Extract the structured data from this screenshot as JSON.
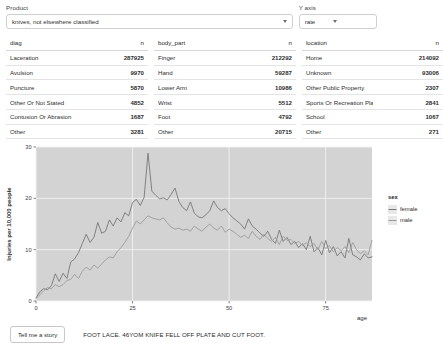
{
  "controls": {
    "product": {
      "label": "Product",
      "value": "knives, not elsewhere classified",
      "caret": "chevron-down-icon"
    },
    "yaxis": {
      "label": "Y axis",
      "value": "rate",
      "caret": "chevron-down-icon"
    }
  },
  "tables": [
    {
      "id": "diag",
      "headers": [
        "diag",
        "n"
      ],
      "rows": [
        {
          "label": "Laceration",
          "n": "287925"
        },
        {
          "label": "Avulsion",
          "n": "9970"
        },
        {
          "label": "Puncture",
          "n": "5870"
        },
        {
          "label": "Other Or Not Stated",
          "n": "4852"
        },
        {
          "label": "Contusion Or Abrasion",
          "n": "1687"
        },
        {
          "label": "Other",
          "n": "3281"
        }
      ]
    },
    {
      "id": "body_part",
      "headers": [
        "body_part",
        "n"
      ],
      "rows": [
        {
          "label": "Finger",
          "n": "212292"
        },
        {
          "label": "Hand",
          "n": "59287"
        },
        {
          "label": "Lower Arm",
          "n": "10986"
        },
        {
          "label": "Wrist",
          "n": "5512"
        },
        {
          "label": "Foot",
          "n": "4792"
        },
        {
          "label": "Other",
          "n": "20715"
        }
      ]
    },
    {
      "id": "location",
      "headers": [
        "location",
        "n"
      ],
      "rows": [
        {
          "label": "Home",
          "n": "214092"
        },
        {
          "label": "Unknown",
          "n": "93006"
        },
        {
          "label": "Other Public Property",
          "n": "2307"
        },
        {
          "label": "Sports Or Recreation Place",
          "n": "2841"
        },
        {
          "label": "School",
          "n": "1067"
        },
        {
          "label": "Other",
          "n": "271"
        }
      ]
    }
  ],
  "chart_data": {
    "type": "line",
    "title": "",
    "xlabel": "age",
    "ylabel": "Injuries per 10,000 people",
    "xlim": [
      0,
      87
    ],
    "ylim": [
      0,
      30
    ],
    "xticks": [
      0,
      25,
      50,
      75
    ],
    "yticks": [
      0,
      10,
      20,
      30
    ],
    "grid": true,
    "legend": {
      "title": "sex",
      "position": "right",
      "entries": [
        {
          "name": "female",
          "color": "#7a7a7a"
        },
        {
          "name": "male",
          "color": "#9a9a9a"
        }
      ]
    },
    "panel_bg": "#d3d3d3",
    "grid_color": "#f2f2f2",
    "x": [
      0,
      1,
      2,
      3,
      4,
      5,
      6,
      7,
      8,
      9,
      10,
      11,
      12,
      13,
      14,
      15,
      16,
      17,
      18,
      19,
      20,
      21,
      22,
      23,
      24,
      25,
      26,
      27,
      28,
      29,
      30,
      31,
      32,
      33,
      34,
      35,
      36,
      37,
      38,
      39,
      40,
      41,
      42,
      43,
      44,
      45,
      46,
      47,
      48,
      49,
      50,
      51,
      52,
      53,
      54,
      55,
      56,
      57,
      58,
      59,
      60,
      61,
      62,
      63,
      64,
      65,
      66,
      67,
      68,
      69,
      70,
      71,
      72,
      73,
      74,
      75,
      76,
      77,
      78,
      79,
      80,
      81,
      82,
      83,
      84,
      85,
      86,
      87
    ],
    "series": [
      {
        "name": "female",
        "color": "#777777",
        "values": [
          0.6,
          1.8,
          2.4,
          2.2,
          3.0,
          5.3,
          3.8,
          5.4,
          4.4,
          7.6,
          8.2,
          9.4,
          11.2,
          13.0,
          11.4,
          12.4,
          15.3,
          13.2,
          13.6,
          15.8,
          14.6,
          16.2,
          15.4,
          17.2,
          16.6,
          19.2,
          19.8,
          18.6,
          20.2,
          28.8,
          21.4,
          20.6,
          19.9,
          20.1,
          19.7,
          20.8,
          22.0,
          19.4,
          18.2,
          17.6,
          19.3,
          17.1,
          16.4,
          16.2,
          16.8,
          17.6,
          19.5,
          18.2,
          17.6,
          18.0,
          17.0,
          16.2,
          15.6,
          15.0,
          14.0,
          16.0,
          14.6,
          14.0,
          13.2,
          12.6,
          13.6,
          12.0,
          11.2,
          13.8,
          11.6,
          12.4,
          11.0,
          11.6,
          10.4,
          11.2,
          10.0,
          12.6,
          9.6,
          10.4,
          9.0,
          11.8,
          9.4,
          10.6,
          8.8,
          9.6,
          8.4,
          12.2,
          9.0,
          8.6,
          8.0,
          9.2,
          8.4,
          8.6
        ]
      },
      {
        "name": "male",
        "color": "#9c9c9c",
        "values": [
          0.5,
          1.2,
          2.0,
          2.6,
          2.4,
          3.2,
          2.8,
          3.2,
          4.0,
          4.2,
          5.2,
          4.4,
          5.8,
          6.6,
          6.0,
          7.0,
          6.4,
          7.2,
          8.0,
          8.6,
          8.4,
          9.6,
          10.4,
          11.4,
          12.6,
          14.2,
          15.6,
          15.0,
          15.8,
          16.6,
          16.2,
          16.0,
          15.8,
          16.2,
          15.2,
          14.4,
          14.0,
          14.2,
          13.8,
          14.0,
          13.6,
          14.6,
          14.0,
          13.6,
          14.4,
          15.0,
          14.2,
          13.8,
          14.6,
          13.4,
          14.0,
          13.6,
          13.0,
          12.4,
          12.8,
          12.2,
          13.6,
          12.6,
          12.0,
          13.0,
          12.2,
          11.6,
          12.4,
          11.0,
          12.6,
          11.8,
          12.0,
          11.2,
          11.6,
          10.8,
          11.4,
          10.6,
          11.2,
          10.0,
          11.6,
          10.2,
          10.8,
          9.6,
          10.4,
          9.8,
          10.6,
          9.4,
          11.4,
          10.0,
          9.2,
          9.8,
          9.0,
          11.8
        ]
      }
    ]
  },
  "footer": {
    "button_label": "Tell me a story",
    "story": "FOOT LACE. 46YOM KNIFE FELL OFF PLATE AND CUT FOOT."
  }
}
